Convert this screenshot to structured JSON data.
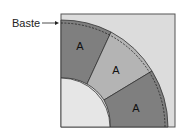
{
  "diagram": {
    "callout_label": "Baste",
    "pieces": [
      {
        "label": "A",
        "shade": "dark"
      },
      {
        "label": "A",
        "shade": "light"
      },
      {
        "label": "A",
        "shade": "dark"
      }
    ],
    "colors": {
      "background_square": "#dcdcdc",
      "dark_piece": "#7f7f7f",
      "light_piece": "#b4b4b4",
      "inner_quarter_circle": "#e6e6e6",
      "outline": "#333333"
    }
  }
}
